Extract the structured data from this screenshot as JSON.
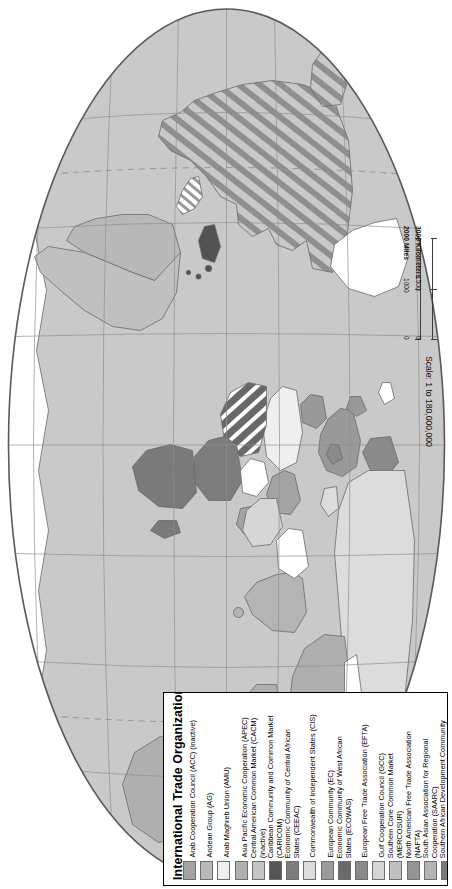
{
  "map": {
    "projection_note": "elliptical world map rotated 90 degrees clockwise",
    "ocean_color": "#c9c9c9",
    "land_default_color": "#c9c9c9",
    "no_org_color": "#ffffff",
    "border_color": "#6b6b6b",
    "graticule_color": "#8d8d8d",
    "outline_color": "#5a5a5a"
  },
  "scale": {
    "ratio_text": "Scale: 1 to 180,000,000",
    "miles_unit": "2000 Miles",
    "kilometers_unit": "3000 Kilometers",
    "miles_ticks": [
      "0",
      "1000",
      "2000"
    ],
    "kilometers_ticks": [
      "0",
      "1500",
      "3000"
    ]
  },
  "legend": {
    "title": "International Trade Organizations",
    "items": [
      {
        "label_line1": "Arab Cooperation Council (ACC) (inactive)",
        "label_line2": "",
        "color": "#a3a3a3"
      },
      {
        "label_line1": "Andean Group (AG)",
        "label_line2": "",
        "color": "#b9b9b9"
      },
      {
        "label_line1": "Arab Maghreb Union (AMU)",
        "label_line2": "",
        "color": "#efefef"
      },
      {
        "label_line1": "Asia Pacific Economic Cooperation (APEC)",
        "label_line2": "",
        "color": "#b0b0b0"
      },
      {
        "label_line1": "Central American Common Market (CACM)",
        "label_line2": "(inactive)",
        "color": "#c4c4c4"
      },
      {
        "label_line1": "Caribbean Community and Common Market",
        "label_line2": "(CARICOM)",
        "color": "#545454"
      },
      {
        "label_line1": "Economic Community of Central African",
        "label_line2": "States (CEEAC)",
        "color": "#7d7d7d"
      },
      {
        "label_line1": "Commonwealth of Independent States (CIS)",
        "label_line2": "",
        "color": "#dcdcdc"
      },
      {
        "label_line1": "European Community (EC)",
        "label_line2": "",
        "color": "#9a9a9a"
      },
      {
        "label_line1": "Economic Community of West African",
        "label_line2": "States (ECOWAS)",
        "color": "#6a6a6a"
      },
      {
        "label_line1": "European Free Trade Association (EFTA)",
        "label_line2": "",
        "color": "#8a8a8a"
      },
      {
        "label_line1": "Gulf Cooperation Council (GCC)",
        "label_line2": "",
        "color": "#d6d6d6"
      },
      {
        "label_line1": "Southern Cone Common Market",
        "label_line2": "(MERCOSUR)",
        "color": "#c0c0c0"
      },
      {
        "label_line1": "North American Free Trade Association",
        "label_line2": "(NAFTA)",
        "color": "#949494"
      },
      {
        "label_line1": "South Asian Association for Regional",
        "label_line2": "Cooperation (SAARC)",
        "color": "#b4b4b4"
      },
      {
        "label_line1": "Southern African Development Community",
        "label_line2": "(SADC)",
        "color": "#7a7a7a"
      }
    ]
  }
}
